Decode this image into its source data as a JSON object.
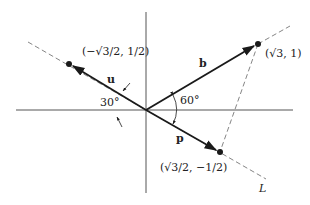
{
  "diagram": {
    "type": "vector projection",
    "axes": {
      "color": "#444444"
    },
    "vectors": {
      "u": {
        "label": "u",
        "point_label": "(−√3/2, 1/2)"
      },
      "b": {
        "label": "b",
        "point_label": "(√3, 1)"
      },
      "p": {
        "label": "p",
        "point_label": "(√3/2, −1/2)"
      }
    },
    "angles": {
      "u_angle": "30°",
      "b_p_angle": "60°"
    },
    "line": {
      "label": "L"
    },
    "colors": {
      "ink": "#1a1a1a",
      "dashed": "#555555"
    }
  }
}
